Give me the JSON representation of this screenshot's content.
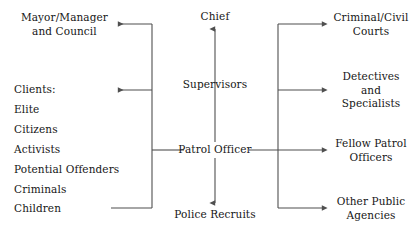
{
  "diagram": {
    "line_color": "#4f4f4f",
    "text_color": "#161616",
    "background_color": "#ffffff",
    "center_column": {
      "chief": "Chief",
      "supervisors": "Supervisors",
      "patrol_officer": "Patrol Officer",
      "police_recruits": "Police Recruits"
    },
    "left_column": {
      "mayor": "Mayor/Manager\nand Council",
      "clients_heading": "Clients:",
      "clients": [
        "Elite",
        "Citizens",
        "Activists",
        "Potential Offenders",
        "Criminals",
        "Children"
      ]
    },
    "right_column": [
      "Criminal/Civil\nCourts",
      "Detectives and\nSpecialists",
      "Fellow Patrol\nOfficers",
      "Other Public\nAgencies"
    ]
  }
}
